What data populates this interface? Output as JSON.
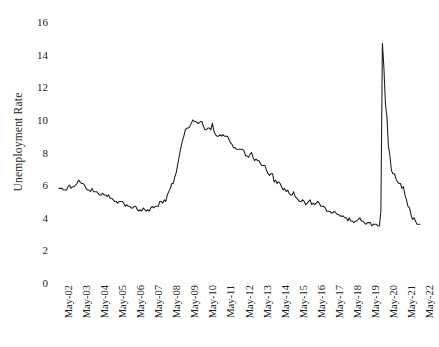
{
  "chart_data": {
    "type": "line",
    "title": "",
    "xlabel": "",
    "ylabel": "Unemployment Rate",
    "ylim": [
      0,
      16
    ],
    "ytick_step": 2,
    "ytick_labels": [
      "0",
      "2",
      "4",
      "6",
      "8",
      "10",
      "12",
      "14",
      "16"
    ],
    "grid": true,
    "legend": "none",
    "line_color": "#1a1a1a",
    "background_color": "#ffffff",
    "x_tick_labels": [
      "May-02",
      "May-03",
      "May-04",
      "May-05",
      "May-06",
      "May-07",
      "May-08",
      "May-09",
      "May-10",
      "May-11",
      "May-12",
      "May-13",
      "May-14",
      "May-15",
      "May-16",
      "May-17",
      "May-18",
      "May-19",
      "May-20",
      "May-21",
      "May-22"
    ],
    "x_domain": [
      "May-02",
      "May-22"
    ],
    "series": [
      {
        "name": "Unemployment Rate",
        "x": [
          "May-02",
          "Jun-02",
          "Jul-02",
          "Aug-02",
          "Sep-02",
          "Oct-02",
          "Nov-02",
          "Dec-02",
          "Jan-03",
          "Feb-03",
          "Mar-03",
          "Apr-03",
          "May-03",
          "Jun-03",
          "Jul-03",
          "Aug-03",
          "Sep-03",
          "Oct-03",
          "Nov-03",
          "Dec-03",
          "Jan-04",
          "Feb-04",
          "Mar-04",
          "Apr-04",
          "May-04",
          "Jun-04",
          "Jul-04",
          "Aug-04",
          "Sep-04",
          "Oct-04",
          "Nov-04",
          "Dec-04",
          "Jan-05",
          "Feb-05",
          "Mar-05",
          "Apr-05",
          "May-05",
          "Jun-05",
          "Jul-05",
          "Aug-05",
          "Sep-05",
          "Oct-05",
          "Nov-05",
          "Dec-05",
          "Jan-06",
          "Feb-06",
          "Mar-06",
          "Apr-06",
          "May-06",
          "Jun-06",
          "Jul-06",
          "Aug-06",
          "Sep-06",
          "Oct-06",
          "Nov-06",
          "Dec-06",
          "Jan-07",
          "Feb-07",
          "Mar-07",
          "Apr-07",
          "May-07",
          "Jun-07",
          "Jul-07",
          "Aug-07",
          "Sep-07",
          "Oct-07",
          "Nov-07",
          "Dec-07",
          "Jan-08",
          "Feb-08",
          "Mar-08",
          "Apr-08",
          "May-08",
          "Jun-08",
          "Jul-08",
          "Aug-08",
          "Sep-08",
          "Oct-08",
          "Nov-08",
          "Dec-08",
          "Jan-09",
          "Feb-09",
          "Mar-09",
          "Apr-09",
          "May-09",
          "Jun-09",
          "Jul-09",
          "Aug-09",
          "Sep-09",
          "Oct-09",
          "Nov-09",
          "Dec-09",
          "Jan-10",
          "Feb-10",
          "Mar-10",
          "Apr-10",
          "May-10",
          "Jun-10",
          "Jul-10",
          "Aug-10",
          "Sep-10",
          "Oct-10",
          "Nov-10",
          "Dec-10",
          "Jan-11",
          "Feb-11",
          "Mar-11",
          "Apr-11",
          "May-11",
          "Jun-11",
          "Jul-11",
          "Aug-11",
          "Sep-11",
          "Oct-11",
          "Nov-11",
          "Dec-11",
          "Jan-12",
          "Feb-12",
          "Mar-12",
          "Apr-12",
          "May-12",
          "Jun-12",
          "Jul-12",
          "Aug-12",
          "Sep-12",
          "Oct-12",
          "Nov-12",
          "Dec-12",
          "Jan-13",
          "Feb-13",
          "Mar-13",
          "Apr-13",
          "May-13",
          "Jun-13",
          "Jul-13",
          "Aug-13",
          "Sep-13",
          "Oct-13",
          "Nov-13",
          "Dec-13",
          "Jan-14",
          "Feb-14",
          "Mar-14",
          "Apr-14",
          "May-14",
          "Jun-14",
          "Jul-14",
          "Aug-14",
          "Sep-14",
          "Oct-14",
          "Nov-14",
          "Dec-14",
          "Jan-15",
          "Feb-15",
          "Mar-15",
          "Apr-15",
          "May-15",
          "Jun-15",
          "Jul-15",
          "Aug-15",
          "Sep-15",
          "Oct-15",
          "Nov-15",
          "Dec-15",
          "Jan-16",
          "Feb-16",
          "Mar-16",
          "Apr-16",
          "May-16",
          "Jun-16",
          "Jul-16",
          "Aug-16",
          "Sep-16",
          "Oct-16",
          "Nov-16",
          "Dec-16",
          "Jan-17",
          "Feb-17",
          "Mar-17",
          "Apr-17",
          "May-17",
          "Jun-17",
          "Jul-17",
          "Aug-17",
          "Sep-17",
          "Oct-17",
          "Nov-17",
          "Dec-17",
          "Jan-18",
          "Feb-18",
          "Mar-18",
          "Apr-18",
          "May-18",
          "Jun-18",
          "Jul-18",
          "Aug-18",
          "Sep-18",
          "Oct-18",
          "Nov-18",
          "Dec-18",
          "Jan-19",
          "Feb-19",
          "Mar-19",
          "Apr-19",
          "May-19",
          "Jun-19",
          "Jul-19",
          "Aug-19",
          "Sep-19",
          "Oct-19",
          "Nov-19",
          "Dec-19",
          "Jan-20",
          "Feb-20",
          "Mar-20",
          "Apr-20",
          "May-20",
          "Jun-20",
          "Jul-20",
          "Aug-20",
          "Sep-20",
          "Oct-20",
          "Nov-20",
          "Dec-20",
          "Jan-21",
          "Feb-21",
          "Mar-21",
          "Apr-21",
          "May-21",
          "Jun-21",
          "Jul-21",
          "Aug-21",
          "Sep-21",
          "Oct-21",
          "Nov-21",
          "Dec-21",
          "Jan-22",
          "Feb-22",
          "Mar-22",
          "Apr-22",
          "May-22"
        ],
        "values": [
          5.8,
          5.8,
          5.8,
          5.7,
          5.7,
          5.7,
          5.9,
          6.0,
          5.8,
          5.9,
          5.9,
          6.0,
          6.1,
          6.3,
          6.2,
          6.1,
          6.1,
          6.0,
          5.8,
          5.7,
          5.7,
          5.6,
          5.8,
          5.6,
          5.6,
          5.6,
          5.5,
          5.4,
          5.4,
          5.5,
          5.4,
          5.4,
          5.3,
          5.4,
          5.2,
          5.2,
          5.1,
          5.0,
          5.0,
          4.9,
          5.0,
          5.0,
          5.0,
          4.9,
          4.7,
          4.8,
          4.7,
          4.7,
          4.6,
          4.6,
          4.7,
          4.7,
          4.5,
          4.4,
          4.5,
          4.4,
          4.6,
          4.5,
          4.4,
          4.5,
          4.4,
          4.6,
          4.7,
          4.6,
          4.7,
          4.7,
          4.7,
          5.0,
          5.0,
          4.9,
          5.1,
          5.0,
          5.4,
          5.6,
          5.8,
          6.1,
          6.1,
          6.5,
          6.8,
          7.3,
          7.8,
          8.3,
          8.7,
          9.0,
          9.4,
          9.5,
          9.5,
          9.6,
          9.8,
          10.0,
          9.9,
          9.9,
          9.8,
          9.8,
          9.9,
          9.9,
          9.6,
          9.4,
          9.4,
          9.5,
          9.5,
          9.4,
          9.8,
          9.3,
          9.1,
          9.0,
          9.0,
          9.1,
          9.0,
          9.1,
          9.0,
          9.0,
          9.0,
          8.8,
          8.6,
          8.5,
          8.3,
          8.3,
          8.2,
          8.2,
          8.2,
          8.2,
          8.2,
          8.1,
          7.8,
          7.8,
          7.7,
          7.9,
          8.0,
          7.7,
          7.5,
          7.6,
          7.5,
          7.5,
          7.3,
          7.2,
          7.2,
          7.2,
          6.9,
          6.7,
          6.6,
          6.7,
          6.7,
          6.2,
          6.3,
          6.1,
          6.2,
          6.1,
          5.9,
          5.7,
          5.8,
          5.6,
          5.7,
          5.5,
          5.4,
          5.4,
          5.6,
          5.3,
          5.2,
          5.1,
          5.0,
          5.0,
          5.1,
          5.0,
          4.8,
          4.9,
          5.0,
          5.1,
          4.8,
          4.9,
          4.8,
          4.9,
          5.0,
          4.9,
          4.7,
          4.7,
          4.7,
          4.6,
          4.4,
          4.4,
          4.4,
          4.3,
          4.3,
          4.4,
          4.3,
          4.2,
          4.2,
          4.1,
          4.1,
          4.1,
          4.0,
          4.0,
          3.8,
          4.0,
          3.8,
          3.8,
          3.7,
          3.8,
          3.8,
          3.9,
          4.0,
          3.8,
          3.8,
          3.7,
          3.6,
          3.7,
          3.7,
          3.7,
          3.5,
          3.6,
          3.6,
          3.6,
          3.5,
          3.5,
          4.4,
          14.7,
          13.2,
          11.0,
          10.2,
          8.4,
          7.8,
          6.9,
          6.7,
          6.7,
          6.4,
          6.2,
          6.1,
          6.1,
          5.8,
          5.9,
          5.4,
          5.1,
          4.7,
          4.6,
          4.2,
          3.9,
          4.0,
          3.8,
          3.6,
          3.6,
          3.6
        ]
      }
    ],
    "annotations": {
      "covid_peak": {
        "label": "May-20",
        "value": 14.7
      },
      "great_recession_peak": {
        "label": "Oct-09",
        "value": 10.0
      },
      "pre_covid_trough": {
        "label": "Feb-20",
        "value": 3.5
      },
      "series_end": {
        "label": "May-22",
        "value": 3.6
      }
    }
  }
}
